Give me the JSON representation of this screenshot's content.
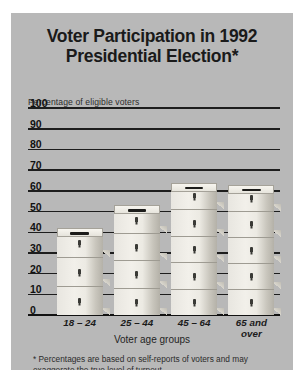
{
  "figure": {
    "title_lines": [
      "Voter Participation in 1992",
      "Presidential Election*"
    ],
    "axis_caption": "Percentage of eligible voters",
    "x_axis_title": "Voter age groups",
    "footnote": "* Percentages are based on self-reports of voters and may exaggerate the true level of turnout.",
    "background_color": "#b8b8b8",
    "gridline_color": "#1d1d1d",
    "box_fill_color": "#eeece5"
  },
  "chart_data": {
    "type": "bar",
    "xlabel": "Voter age groups",
    "ylabel": "Percentage of eligible voters",
    "ylim": [
      0,
      100
    ],
    "yticks": [
      0,
      10,
      20,
      30,
      40,
      50,
      60,
      70,
      80,
      90,
      100
    ],
    "ytick_labels": [
      "0",
      "10",
      "20",
      "30",
      "40",
      "50",
      "60",
      "70",
      "80",
      "90",
      "100"
    ],
    "grid": true,
    "legend": "none",
    "categories": [
      "18 – 24",
      "25 – 44",
      "45 – 64",
      "65 and over"
    ],
    "category_label_lines": [
      [
        "18 – 24"
      ],
      [
        "25 – 44"
      ],
      [
        "45 – 64"
      ],
      [
        "65 and",
        "over"
      ]
    ],
    "values": [
      42,
      53,
      64,
      63
    ],
    "bar_segments": [
      3,
      4,
      5,
      5
    ],
    "annotation": "Bars are drawn as stacks of ballot boxes"
  }
}
